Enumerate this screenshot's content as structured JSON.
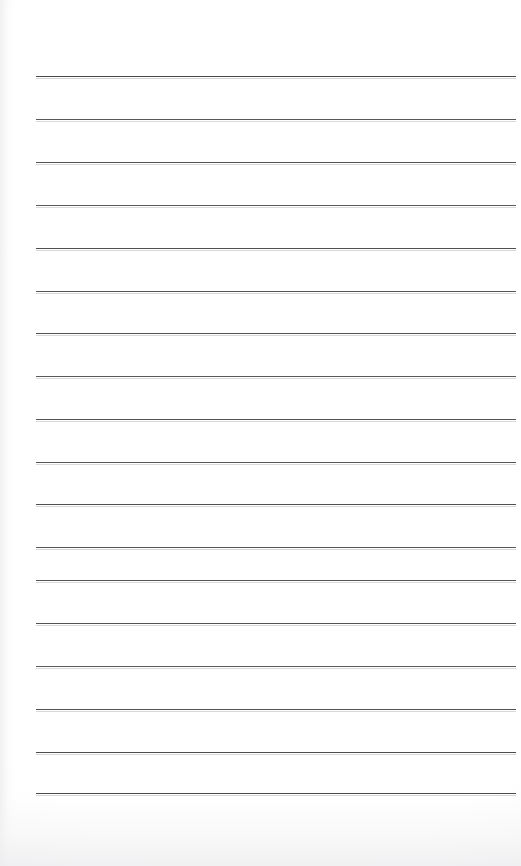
{
  "document": {
    "kind": "scanned-lined-notepad-page",
    "page_background_color": "#ffffff",
    "page_width_px": 521,
    "page_height_px": 866,
    "content_text": "",
    "handwriting_present": "no",
    "printed_text_present": "no"
  },
  "ruling": {
    "label": "ruled-lines",
    "line_color": "#4a4a4d",
    "line_thickness_px": 1.6,
    "line_count": 17,
    "line_left_px": 36,
    "line_right_px": 516,
    "line_length_px": 480,
    "line_spacing_px": 42.8,
    "first_line_y_px": 76,
    "last_line_y_px": 793,
    "top_margin_px": 76,
    "bottom_margin_px": 73,
    "left_margin_px": 36,
    "right_margin_px": 5,
    "lines": [
      {
        "index": 1,
        "y": 76,
        "opacity": 1.0,
        "thickness": 1.7
      },
      {
        "index": 2,
        "y": 119,
        "opacity": 0.92,
        "thickness": 1.5
      },
      {
        "index": 3,
        "y": 162,
        "opacity": 0.95,
        "thickness": 1.6
      },
      {
        "index": 4,
        "y": 205,
        "opacity": 0.9,
        "thickness": 1.5
      },
      {
        "index": 5,
        "y": 248,
        "opacity": 0.97,
        "thickness": 1.7
      },
      {
        "index": 6,
        "y": 291,
        "opacity": 0.93,
        "thickness": 1.6
      },
      {
        "index": 7,
        "y": 333,
        "opacity": 0.96,
        "thickness": 1.6
      },
      {
        "index": 8,
        "y": 376,
        "opacity": 0.91,
        "thickness": 1.5
      },
      {
        "index": 9,
        "y": 419,
        "opacity": 0.95,
        "thickness": 1.6
      },
      {
        "index": 10,
        "y": 462,
        "opacity": 0.93,
        "thickness": 1.6
      },
      {
        "index": 11,
        "y": 504,
        "opacity": 0.97,
        "thickness": 1.7
      },
      {
        "index": 12,
        "y": 547,
        "opacity": 0.92,
        "thickness": 1.5
      },
      {
        "index": 13,
        "y": 623,
        "opacity": 0.95,
        "thickness": 1.6
      },
      {
        "index": 14,
        "y": 666,
        "opacity": 0.9,
        "thickness": 1.5
      },
      {
        "index": 15,
        "y": 709,
        "opacity": 0.96,
        "thickness": 1.6
      },
      {
        "index": 16,
        "y": 752,
        "opacity": 0.98,
        "thickness": 1.7
      },
      {
        "index": 17,
        "y": 793,
        "opacity": 1.0,
        "thickness": 1.7
      }
    ]
  },
  "extra_lines": [
    {
      "index": 12.5,
      "y": 580,
      "opacity": 0.94,
      "thickness": 1.6
    }
  ]
}
